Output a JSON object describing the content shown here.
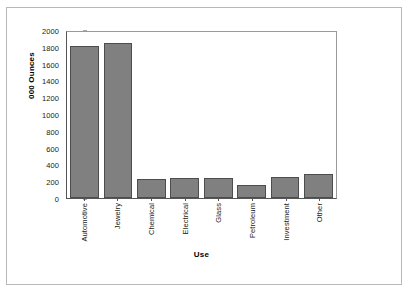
{
  "chart_data": {
    "type": "bar",
    "title": "",
    "xlabel": "Use",
    "ylabel": "000 Ounces",
    "categories": [
      "Automotive",
      "Jewelry",
      "Chemical",
      "Electrical",
      "Glass",
      "Petroleum",
      "Investment",
      "Other"
    ],
    "values": [
      1810,
      1840,
      230,
      240,
      235,
      150,
      250,
      280
    ],
    "ylim": [
      0,
      2000
    ],
    "ytick_labels": [
      "2000",
      "1800",
      "1600",
      "1400",
      "1200",
      "1000",
      "800",
      "600",
      "400",
      "200",
      "0"
    ],
    "ytick_values": [
      2000,
      1800,
      1600,
      1400,
      1200,
      1000,
      800,
      600,
      400,
      200,
      0
    ],
    "ytick_step": 200,
    "grid": false,
    "legend": "none",
    "bar_color": "#808080",
    "bar_border_color": "#4d4d4d",
    "axis_color": "#555555",
    "frame_color": "#b8b8b8"
  }
}
